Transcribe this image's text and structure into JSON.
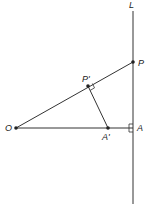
{
  "diagram": {
    "labels": {
      "line": "L",
      "P": "P",
      "P_prime": "P'",
      "O": "O",
      "A": "A",
      "A_prime": "A'"
    },
    "colors": {
      "stroke": "#333333",
      "background": "#ffffff"
    },
    "points": {
      "O": [
        16,
        128
      ],
      "P": [
        133,
        62
      ],
      "A": [
        133,
        128
      ],
      "A_prime": [
        108,
        128
      ],
      "P_prime": [
        88,
        86
      ]
    }
  }
}
